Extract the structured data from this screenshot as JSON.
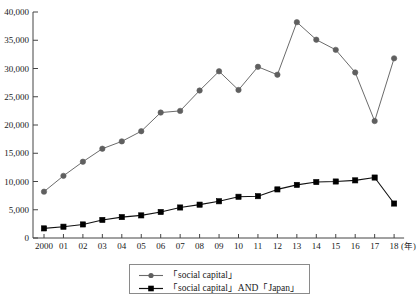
{
  "chart_data": {
    "type": "line",
    "title": "",
    "xlabel": "(年)",
    "ylabel": "",
    "grid": false,
    "legend_position": "bottom-center",
    "xlim": [
      2000,
      2018
    ],
    "ylim": [
      0,
      40000
    ],
    "ytick_labels": [
      "40,000",
      "35,000",
      "30,000",
      "25,000",
      "20,000",
      "15,000",
      "10,000",
      "5,000",
      "0"
    ],
    "ytick_values": [
      40000,
      35000,
      30000,
      25000,
      20000,
      15000,
      10000,
      5000,
      0
    ],
    "xtick_labels": [
      "2000",
      "01",
      "02",
      "03",
      "04",
      "05",
      "06",
      "07",
      "08",
      "09",
      "10",
      "11",
      "12",
      "13",
      "14",
      "15",
      "16",
      "17",
      "18"
    ],
    "x": [
      2000,
      2001,
      2002,
      2003,
      2004,
      2005,
      2006,
      2007,
      2008,
      2009,
      2010,
      2011,
      2012,
      2013,
      2014,
      2015,
      2016,
      2017,
      2018
    ],
    "series": [
      {
        "name": "「social capital」",
        "marker": "circle",
        "color": "#5f5f5f",
        "values": [
          8200,
          11000,
          13500,
          15800,
          17100,
          18900,
          22200,
          22500,
          26100,
          29500,
          26200,
          30300,
          28900,
          38200,
          35100,
          33300,
          29300,
          20700,
          31800
        ]
      },
      {
        "name": "「social capital」AND「Japan」",
        "marker": "square",
        "color": "#000000",
        "values": [
          1700,
          2000,
          2400,
          3200,
          3700,
          4000,
          4600,
          5400,
          5900,
          6500,
          7300,
          7400,
          8600,
          9400,
          9900,
          10000,
          10200,
          10700,
          6100
        ]
      }
    ]
  },
  "legend": {
    "items": [
      {
        "label": "「social capital」"
      },
      {
        "label": "「social capital」AND「Japan」"
      }
    ]
  },
  "axis": {
    "x_unit_label": "(年)"
  }
}
